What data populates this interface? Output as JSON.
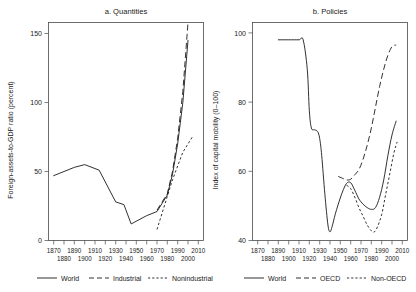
{
  "figure": {
    "background": "#ffffff",
    "ink_color": "#1a1a1a"
  },
  "chart_data": [
    {
      "type": "line",
      "panel_id": "a",
      "title": "a. Quantities",
      "xlabel": "",
      "ylabel": "Foreign-assets-to-GDP ratio (percent)",
      "xlim": [
        1865,
        2015
      ],
      "ylim": [
        0,
        158
      ],
      "yticks": [
        0,
        50,
        100,
        150
      ],
      "ytick_labels": [
        "0",
        "50",
        "100",
        "150"
      ],
      "xticks": [
        1870,
        1880,
        1890,
        1900,
        1910,
        1920,
        1930,
        1940,
        1950,
        1960,
        1970,
        1980,
        1990,
        2000,
        2010
      ],
      "xtick_labels_top": [
        "1870",
        "1890",
        "1910",
        "1930",
        "1950",
        "1970",
        "1990",
        "2010"
      ],
      "xtick_labels_bottom": [
        "1880",
        "1900",
        "1920",
        "1940",
        "1960",
        "1980",
        "2000"
      ],
      "grid": false,
      "legend_position": "bottom",
      "legend": [
        "World",
        "Industrial",
        "Nonindustrial"
      ],
      "series": [
        {
          "name": "World",
          "style": "solid",
          "x": [
            1870,
            1880,
            1890,
            1900,
            1914,
            1930,
            1938,
            1945,
            1960,
            1970,
            1980,
            1985,
            1990,
            1995,
            2000
          ],
          "values": [
            47,
            50,
            53,
            55,
            51,
            28,
            26,
            12,
            18,
            21,
            33,
            48,
            70,
            100,
            145
          ]
        },
        {
          "name": "Industrial",
          "style": "long-dash",
          "x": [
            1970,
            1980,
            1985,
            1990,
            1995,
            2000
          ],
          "values": [
            22,
            34,
            50,
            74,
            108,
            158
          ]
        },
        {
          "name": "Nonindustrial",
          "style": "short-dash",
          "x": [
            1970,
            1980,
            1985,
            1990,
            1995,
            2000,
            2005
          ],
          "values": [
            8,
            32,
            44,
            54,
            64,
            70,
            76
          ]
        }
      ]
    },
    {
      "type": "line",
      "panel_id": "b",
      "title": "b. Policies",
      "xlabel": "",
      "ylabel": "Index of capital mobility (0–100)",
      "xlim": [
        1865,
        2015
      ],
      "ylim": [
        38.5,
        101.5
      ],
      "yticks": [
        40,
        60,
        80,
        100
      ],
      "ytick_labels": [
        "40",
        "60",
        "80",
        "100"
      ],
      "xticks": [
        1870,
        1880,
        1890,
        1900,
        1910,
        1920,
        1930,
        1940,
        1950,
        1960,
        1970,
        1980,
        1990,
        2000,
        2010
      ],
      "xtick_labels_top": [
        "1870",
        "1890",
        "1910",
        "1930",
        "1950",
        "1970",
        "1990",
        "2010"
      ],
      "xtick_labels_bottom": [
        "1880",
        "1900",
        "1920",
        "1940",
        "1960",
        "1980",
        "2000"
      ],
      "grid": false,
      "legend_position": "bottom",
      "legend": [
        "World",
        "OECD",
        "Non-OECD"
      ],
      "series": [
        {
          "name": "World",
          "style": "solid",
          "x": [
            1890,
            1900,
            1910,
            1914,
            1918,
            1920,
            1922,
            1925,
            1928,
            1930,
            1932,
            1935,
            1938,
            1940,
            1942,
            1945,
            1948,
            1952,
            1956,
            1960,
            1964,
            1968,
            1972,
            1976,
            1980,
            1984,
            1988,
            1992,
            1996,
            2000,
            2004
          ],
          "values": [
            96.5,
            96.5,
            96.5,
            96.5,
            88,
            76,
            71,
            70.5,
            70,
            68,
            63,
            52,
            43,
            41,
            42.5,
            46,
            49,
            52.5,
            55,
            55.2,
            53,
            50.5,
            49,
            48,
            47.5,
            48,
            51,
            56,
            63,
            69,
            73
          ]
        },
        {
          "name": "OECD",
          "style": "long-dash",
          "x": [
            1948,
            1952,
            1956,
            1960,
            1964,
            1968,
            1972,
            1976,
            1980,
            1984,
            1988,
            1992,
            1996,
            2000,
            2004
          ],
          "values": [
            57,
            56.5,
            56,
            56.2,
            57.5,
            59,
            62,
            66,
            71,
            77,
            83,
            88,
            92,
            94.5,
            95
          ]
        },
        {
          "name": "Non-OECD",
          "style": "short-dash",
          "x": [
            1956,
            1960,
            1964,
            1968,
            1972,
            1976,
            1980,
            1983,
            1986,
            1990,
            1994,
            1998,
            2002,
            2005
          ],
          "values": [
            54.5,
            53.5,
            51,
            48,
            45.5,
            43,
            41.3,
            41,
            42.5,
            46,
            52,
            58,
            64,
            67
          ]
        }
      ]
    }
  ],
  "legend_a": {
    "items": [
      {
        "label": "World",
        "style": "solid"
      },
      {
        "label": "Industrial",
        "style": "long-dash"
      },
      {
        "label": "Nonindustrial",
        "style": "short-dash"
      }
    ]
  },
  "legend_b": {
    "items": [
      {
        "label": "World",
        "style": "solid"
      },
      {
        "label": "OECD",
        "style": "long-dash"
      },
      {
        "label": "Non-OECD",
        "style": "short-dash"
      }
    ]
  }
}
